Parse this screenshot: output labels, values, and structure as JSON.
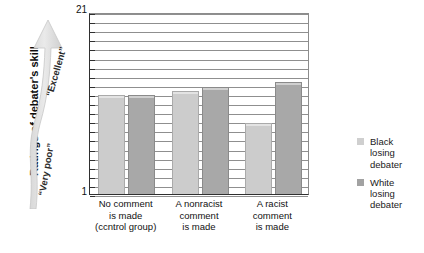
{
  "chart_data": {
    "type": "bar",
    "title": "",
    "xlabel": "",
    "ylabel": "Ratings of debater's skill",
    "ylim": [
      1,
      21
    ],
    "grid": true,
    "legend_position": "right",
    "categories": [
      "No comment is made (ccntrol group)",
      "A nonracist comment is made",
      "A racist comment is made"
    ],
    "series": [
      {
        "name": "Black losing debater",
        "values": [
          11.9,
          12.3,
          8.8
        ],
        "color": "#cccccc"
      },
      {
        "name": "White losing debater",
        "values": [
          11.9,
          12.8,
          13.3
        ],
        "color": "#a8a8a8"
      }
    ],
    "y_ticks": [
      1,
      21
    ],
    "scale_annotations": {
      "high": "“Excellent”",
      "low": "“Very poor”"
    }
  },
  "axis": {
    "y_title": "Ratings of debater's skill",
    "y_max_label": "21",
    "y_min_label": "1"
  },
  "arrow": {
    "top_label": "“Excellent”",
    "bottom_label": "“Very poor”"
  },
  "categories": [
    {
      "line1": "No comment",
      "line2": "is made",
      "line3": "(ccntrol group)"
    },
    {
      "line1": "A nonracist",
      "line2": "comment",
      "line3": "is made"
    },
    {
      "line1": "A racist",
      "line2": "comment",
      "line3": "is made"
    }
  ],
  "legend": [
    {
      "line1": "Black",
      "line2": "losing",
      "line3": "debater",
      "color": "#cfcfcf"
    },
    {
      "line1": "White",
      "line2": "losing",
      "line3": "debater",
      "color": "#a2a2a2"
    }
  ]
}
